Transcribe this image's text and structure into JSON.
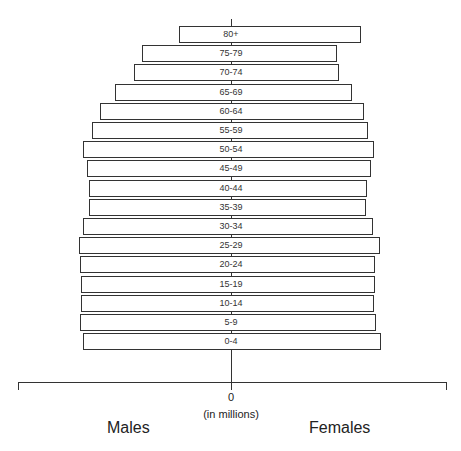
{
  "chart_data": {
    "type": "bar",
    "subtype": "population-pyramid",
    "title": "",
    "xlabel": "(in millions)",
    "x_tick_labels": [
      "0"
    ],
    "legend": [],
    "side_labels": {
      "left": "Males",
      "right": "Females"
    },
    "categories": [
      "80+",
      "75-79",
      "70-74",
      "65-69",
      "60-64",
      "55-59",
      "50-54",
      "45-49",
      "40-44",
      "35-39",
      "30-34",
      "25-29",
      "20-24",
      "15-19",
      "10-14",
      "5-9",
      "0-4"
    ],
    "value_units": "relative (pixels from center; axis unlabeled beyond 0)",
    "axis_half_extent": 214,
    "series": [
      {
        "name": "Males",
        "values": [
          52,
          89,
          97,
          116,
          131,
          139,
          148,
          144,
          142,
          142,
          148,
          152,
          151,
          150,
          150,
          151,
          148
        ]
      },
      {
        "name": "Females",
        "values": [
          130,
          106,
          108,
          121,
          133,
          137,
          143,
          140,
          136,
          135,
          142,
          149,
          144,
          144,
          143,
          145,
          150
        ]
      }
    ],
    "grid": false,
    "orientation": "horizontal"
  },
  "labels": {
    "zero": "0",
    "units": "(in millions)",
    "males": "Males",
    "females": "Females"
  }
}
